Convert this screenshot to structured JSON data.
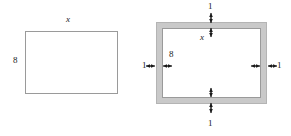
{
  "diagram": {
    "colors": {
      "stroke": "#9a9a9a",
      "border_fill": "#c9c9c9",
      "inner_fill": "#ffffff",
      "arrow": "#1b1b1b",
      "text": "#1b1b1b",
      "background": "#ffffff"
    },
    "figures": [
      {
        "name": "plain-rectangle",
        "labels": {
          "width": "x",
          "height": "8"
        }
      },
      {
        "name": "bordered-rectangle",
        "labels": {
          "inner_width": "x",
          "inner_height": "8",
          "border_top": "1",
          "border_bottom": "1",
          "border_left": "1",
          "border_right": "1"
        }
      }
    ]
  }
}
